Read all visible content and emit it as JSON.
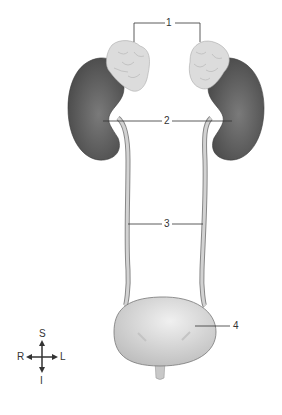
{
  "diagram": {
    "type": "anatomical-illustration",
    "labels": [
      {
        "id": "1",
        "text": "1",
        "target": "adrenal glands"
      },
      {
        "id": "2",
        "text": "2",
        "target": "renal hilum / kidneys"
      },
      {
        "id": "3",
        "text": "3",
        "target": "ureters"
      },
      {
        "id": "4",
        "text": "4",
        "target": "bladder"
      }
    ],
    "compass": {
      "up": "S",
      "down": "I",
      "left": "R",
      "right": "L"
    },
    "colors": {
      "kidney": "#5a5a5a",
      "adrenal": "#dcdcdc",
      "ureter": "#c8c8c8",
      "bladder": "#d9d9d9",
      "leader": "#333333"
    }
  }
}
